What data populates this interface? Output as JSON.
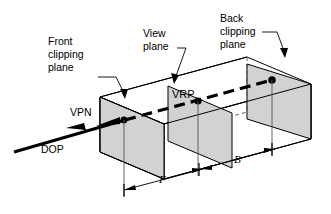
{
  "figure": {
    "kind": "3d-view-volume-diagram",
    "background_color": "#ffffff",
    "line_color": "#000000",
    "plane_fill_color": "#d2d2d2",
    "hidden_line_color": "#8a8a8a"
  },
  "labels": {
    "front_clipping_plane": {
      "line1": "Front",
      "line2": "clipping",
      "line3": "plane"
    },
    "view_plane": {
      "line1": "View",
      "line2": "plane"
    },
    "back_clipping_plane": {
      "line1": "Back",
      "line2": "clipping",
      "line3": "plane"
    },
    "vrp": "VRP",
    "vpn": "VPN",
    "dop": "DOP"
  },
  "dimensions": {
    "front_distance": "F",
    "back_distance": "B"
  }
}
